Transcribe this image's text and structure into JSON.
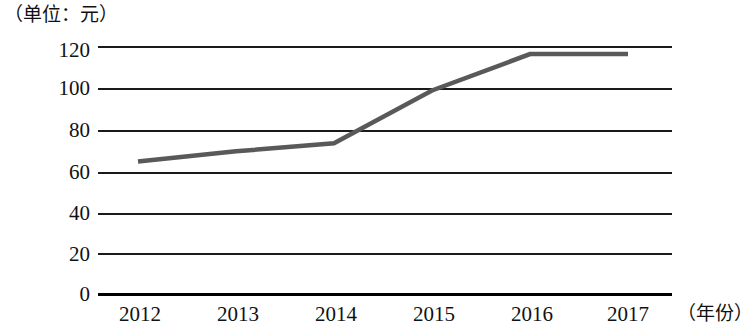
{
  "chart_data": {
    "type": "line",
    "title": "",
    "unit_caption": "（单位：元）",
    "xlabel": "（年份）",
    "ylabel": "",
    "categories": [
      "2012",
      "2013",
      "2014",
      "2015",
      "2016",
      "2017"
    ],
    "values": [
      65,
      70,
      74,
      100,
      118,
      118
    ],
    "series": [
      {
        "name": "价格",
        "values": [
          65,
          70,
          74,
          100,
          118,
          118
        ],
        "color": "#58595b"
      }
    ],
    "ylim": [
      0,
      120
    ],
    "y_ticks": [
      0,
      20,
      40,
      60,
      80,
      100,
      120
    ],
    "y_tick_labels": [
      "0",
      "20",
      "40",
      "60",
      "80",
      "100",
      "120"
    ],
    "x_tick_labels": [
      "2012",
      "2013",
      "2014",
      "2015",
      "2016",
      "2017"
    ],
    "grid": true,
    "grid_axis": "y",
    "legend": false,
    "legend_position": "none",
    "markers": false
  },
  "colors": {
    "line": "#58595b",
    "grid": "#1a1a1a",
    "axis": "#000000",
    "text": "#111111",
    "background": "#ffffff"
  }
}
